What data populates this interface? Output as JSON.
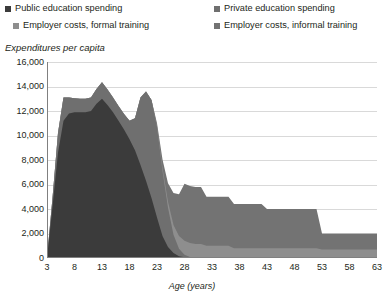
{
  "legend": {
    "items": [
      {
        "label": "Public education spending",
        "color": "#3b3b3b",
        "icon": "square-marker-icon"
      },
      {
        "label": "Private education spending",
        "color": "#6f6f6f",
        "icon": "square-marker-icon"
      },
      {
        "label": "Employer costs, formal training",
        "color": "#8e8e8e",
        "icon": "square-marker-icon"
      },
      {
        "label": "Employer costs, informal training",
        "color": "#737373",
        "icon": "square-marker-icon"
      }
    ]
  },
  "axes": {
    "y_title": "Expenditures per capita",
    "x_title": "Age (years)",
    "y_ticks": [
      "16,000",
      "14,000",
      "12,000",
      "10,000",
      "8,000",
      "6,000",
      "4,000",
      "2,000",
      "0"
    ],
    "x_ticks": [
      "3",
      "8",
      "13",
      "18",
      "23",
      "28",
      "33",
      "38",
      "43",
      "48",
      "53",
      "58",
      "63"
    ]
  },
  "colors": {
    "public": "#3b3b3b",
    "private": "#6f6f6f",
    "formal": "#8e8e8e",
    "informal": "#737373",
    "gridline": "#d9d9d9",
    "axis": "#808080",
    "background": "#ffffff",
    "text": "#231f20"
  },
  "chart_data": {
    "type": "area",
    "stacked": true,
    "title": "",
    "subtitle": "",
    "xlabel": "Age (years)",
    "ylabel": "Expenditures per capita",
    "xlim": [
      3,
      63
    ],
    "ylim": [
      0,
      16000
    ],
    "ytick_step": 2000,
    "xtick_step": 5,
    "grid": "horizontal",
    "legend_position": "top",
    "x": [
      3,
      4,
      5,
      6,
      7,
      8,
      9,
      10,
      11,
      12,
      13,
      14,
      15,
      16,
      17,
      18,
      19,
      20,
      21,
      22,
      23,
      24,
      25,
      26,
      27,
      28,
      29,
      30,
      31,
      32,
      33,
      34,
      35,
      36,
      37,
      38,
      39,
      40,
      41,
      42,
      43,
      44,
      45,
      46,
      47,
      48,
      49,
      50,
      51,
      52,
      53,
      54,
      55,
      56,
      57,
      58,
      59,
      60,
      61,
      62,
      63
    ],
    "series": [
      {
        "name": "Public education spending",
        "color": "#3b3b3b",
        "values": [
          0,
          4200,
          8600,
          11200,
          11800,
          11900,
          11900,
          11900,
          12000,
          12600,
          13000,
          12500,
          11900,
          11200,
          10500,
          9700,
          8800,
          7600,
          6300,
          4900,
          3300,
          1800,
          900,
          400,
          150,
          60,
          20,
          0,
          0,
          0,
          0,
          0,
          0,
          0,
          0,
          0,
          0,
          0,
          0,
          0,
          0,
          0,
          0,
          0,
          0,
          0,
          0,
          0,
          0,
          0,
          0,
          0,
          0,
          0,
          0,
          0,
          0,
          0,
          0,
          0,
          0
        ]
      },
      {
        "name": "Private education spending",
        "color": "#6f6f6f",
        "values": [
          0,
          700,
          1600,
          1900,
          1300,
          1150,
          1100,
          1100,
          1100,
          1200,
          1350,
          1250,
          1200,
          1200,
          1250,
          1500,
          2600,
          5500,
          7300,
          8000,
          7400,
          5300,
          3200,
          1500,
          600,
          200,
          60,
          0,
          0,
          0,
          0,
          0,
          0,
          0,
          0,
          0,
          0,
          0,
          0,
          0,
          0,
          0,
          0,
          0,
          0,
          0,
          0,
          0,
          0,
          0,
          0,
          0,
          0,
          0,
          0,
          0,
          0,
          0,
          0,
          0,
          0
        ]
      },
      {
        "name": "Employer costs, formal training",
        "color": "#8e8e8e",
        "values": [
          0,
          0,
          0,
          0,
          0,
          0,
          0,
          0,
          0,
          0,
          0,
          0,
          0,
          0,
          0,
          0,
          0,
          0,
          0,
          0,
          100,
          250,
          500,
          800,
          1050,
          1150,
          1150,
          1150,
          1150,
          1000,
          1000,
          1000,
          1000,
          1000,
          800,
          800,
          800,
          800,
          800,
          800,
          800,
          800,
          800,
          800,
          800,
          800,
          800,
          800,
          800,
          800,
          700,
          700,
          700,
          700,
          700,
          700,
          700,
          700,
          700,
          700,
          700
        ]
      },
      {
        "name": "Employer costs, informal training",
        "color": "#737373",
        "values": [
          0,
          0,
          0,
          0,
          0,
          0,
          0,
          0,
          0,
          0,
          0,
          0,
          0,
          0,
          0,
          0,
          0,
          0,
          0,
          0,
          200,
          700,
          1500,
          2600,
          3400,
          4650,
          4650,
          4650,
          4650,
          4000,
          4000,
          4000,
          4000,
          4000,
          3600,
          3600,
          3600,
          3600,
          3600,
          3600,
          3200,
          3200,
          3200,
          3200,
          3200,
          3200,
          3200,
          3200,
          3200,
          3200,
          1300,
          1300,
          1300,
          1300,
          1300,
          1300,
          1300,
          1300,
          1300,
          1300,
          1300
        ]
      }
    ]
  }
}
